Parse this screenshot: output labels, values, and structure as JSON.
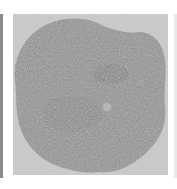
{
  "image": {
    "description": "Grayscale speckled blob on light gray square background",
    "colors": {
      "background": "#c4c4c4",
      "blob": "#8e8e8e",
      "blob_dark": "#7a7a7a",
      "highlight": "#b8b8b8",
      "left_strip": "#8a8a8a"
    }
  }
}
